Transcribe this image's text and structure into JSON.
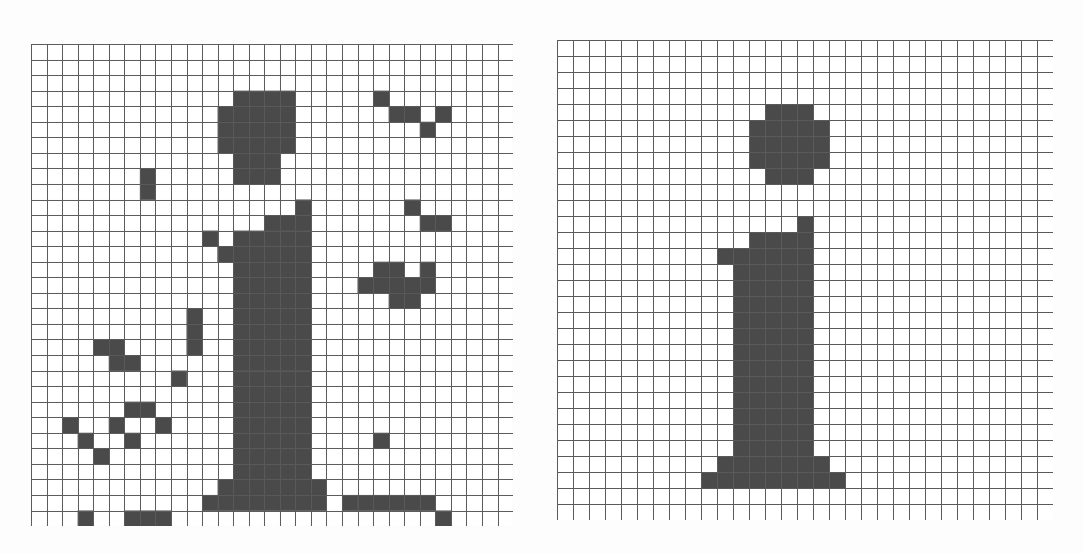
{
  "document": {
    "title": "Bitmap character grids — noisy and clean rendering of the letter i",
    "background_color": "#fdfdfd",
    "width": 1083,
    "height": 554
  },
  "style": {
    "cell_fill_color": "#4a4a4a",
    "grid_line_color": "#5a5a5a",
    "grid_line_width": 1,
    "empty_cell_color": "#ffffff"
  },
  "panels": [
    {
      "id": "left-panel",
      "name": "noisy-bitmap-grid",
      "label": "Noisy bitmap of letter i",
      "origin_x": 31,
      "origin_y": 44,
      "cell_size": 15.55,
      "cols": 31,
      "rows": 31,
      "filled_cells": [
        [
          13,
          3
        ],
        [
          14,
          3
        ],
        [
          15,
          3
        ],
        [
          16,
          3
        ],
        [
          22,
          3
        ],
        [
          12,
          4
        ],
        [
          13,
          4
        ],
        [
          14,
          4
        ],
        [
          15,
          4
        ],
        [
          16,
          4
        ],
        [
          23,
          4
        ],
        [
          24,
          4
        ],
        [
          26,
          4
        ],
        [
          12,
          5
        ],
        [
          13,
          5
        ],
        [
          14,
          5
        ],
        [
          15,
          5
        ],
        [
          16,
          5
        ],
        [
          25,
          5
        ],
        [
          12,
          6
        ],
        [
          13,
          6
        ],
        [
          14,
          6
        ],
        [
          15,
          6
        ],
        [
          16,
          6
        ],
        [
          13,
          7
        ],
        [
          14,
          7
        ],
        [
          15,
          7
        ],
        [
          7,
          8
        ],
        [
          13,
          8
        ],
        [
          14,
          8
        ],
        [
          15,
          8
        ],
        [
          7,
          9
        ],
        [
          17,
          10
        ],
        [
          24,
          10
        ],
        [
          15,
          11
        ],
        [
          16,
          11
        ],
        [
          17,
          11
        ],
        [
          25,
          11
        ],
        [
          26,
          11
        ],
        [
          11,
          12
        ],
        [
          12,
          13
        ],
        [
          13,
          12
        ],
        [
          14,
          12
        ],
        [
          15,
          12
        ],
        [
          16,
          12
        ],
        [
          17,
          12
        ],
        [
          12,
          13
        ],
        [
          13,
          13
        ],
        [
          14,
          13
        ],
        [
          15,
          13
        ],
        [
          16,
          13
        ],
        [
          17,
          13
        ],
        [
          13,
          14
        ],
        [
          14,
          14
        ],
        [
          15,
          14
        ],
        [
          16,
          14
        ],
        [
          17,
          14
        ],
        [
          22,
          14
        ],
        [
          23,
          14
        ],
        [
          25,
          14
        ],
        [
          13,
          15
        ],
        [
          14,
          15
        ],
        [
          15,
          15
        ],
        [
          16,
          15
        ],
        [
          17,
          15
        ],
        [
          21,
          15
        ],
        [
          22,
          15
        ],
        [
          23,
          15
        ],
        [
          24,
          15
        ],
        [
          25,
          15
        ],
        [
          13,
          16
        ],
        [
          14,
          16
        ],
        [
          15,
          16
        ],
        [
          16,
          16
        ],
        [
          17,
          16
        ],
        [
          23,
          16
        ],
        [
          24,
          16
        ],
        [
          10,
          17
        ],
        [
          13,
          17
        ],
        [
          14,
          17
        ],
        [
          15,
          17
        ],
        [
          16,
          17
        ],
        [
          17,
          17
        ],
        [
          10,
          18
        ],
        [
          13,
          18
        ],
        [
          14,
          18
        ],
        [
          15,
          18
        ],
        [
          16,
          18
        ],
        [
          17,
          18
        ],
        [
          4,
          19
        ],
        [
          5,
          19
        ],
        [
          10,
          19
        ],
        [
          13,
          19
        ],
        [
          14,
          19
        ],
        [
          15,
          19
        ],
        [
          16,
          19
        ],
        [
          17,
          19
        ],
        [
          5,
          20
        ],
        [
          6,
          20
        ],
        [
          13,
          20
        ],
        [
          14,
          20
        ],
        [
          15,
          20
        ],
        [
          16,
          20
        ],
        [
          17,
          20
        ],
        [
          9,
          21
        ],
        [
          13,
          21
        ],
        [
          14,
          21
        ],
        [
          15,
          21
        ],
        [
          16,
          21
        ],
        [
          17,
          21
        ],
        [
          13,
          22
        ],
        [
          14,
          22
        ],
        [
          15,
          22
        ],
        [
          16,
          22
        ],
        [
          17,
          22
        ],
        [
          6,
          23
        ],
        [
          7,
          23
        ],
        [
          13,
          23
        ],
        [
          14,
          23
        ],
        [
          15,
          23
        ],
        [
          16,
          23
        ],
        [
          17,
          23
        ],
        [
          2,
          24
        ],
        [
          5,
          24
        ],
        [
          8,
          24
        ],
        [
          13,
          24
        ],
        [
          14,
          24
        ],
        [
          15,
          24
        ],
        [
          16,
          24
        ],
        [
          17,
          24
        ],
        [
          3,
          25
        ],
        [
          6,
          25
        ],
        [
          13,
          25
        ],
        [
          14,
          25
        ],
        [
          15,
          25
        ],
        [
          16,
          25
        ],
        [
          17,
          25
        ],
        [
          22,
          25
        ],
        [
          4,
          26
        ],
        [
          13,
          26
        ],
        [
          14,
          26
        ],
        [
          15,
          26
        ],
        [
          16,
          26
        ],
        [
          17,
          26
        ],
        [
          13,
          27
        ],
        [
          14,
          27
        ],
        [
          15,
          27
        ],
        [
          16,
          27
        ],
        [
          17,
          27
        ],
        [
          12,
          28
        ],
        [
          13,
          28
        ],
        [
          14,
          28
        ],
        [
          15,
          28
        ],
        [
          16,
          28
        ],
        [
          17,
          28
        ],
        [
          18,
          28
        ],
        [
          11,
          29
        ],
        [
          12,
          29
        ],
        [
          13,
          29
        ],
        [
          14,
          29
        ],
        [
          15,
          29
        ],
        [
          16,
          29
        ],
        [
          17,
          29
        ],
        [
          18,
          29
        ],
        [
          20,
          29
        ],
        [
          21,
          29
        ],
        [
          22,
          29
        ],
        [
          23,
          29
        ],
        [
          24,
          29
        ],
        [
          25,
          29
        ],
        [
          3,
          30
        ],
        [
          6,
          30
        ],
        [
          7,
          30
        ],
        [
          8,
          30
        ],
        [
          26,
          30
        ]
      ]
    },
    {
      "id": "right-panel",
      "name": "clean-bitmap-grid",
      "label": "Clean bitmap of letter i",
      "origin_x": 557,
      "origin_y": 40,
      "cell_size": 16.0,
      "cols": 31,
      "rows": 30,
      "filled_cells": [
        [
          13,
          4
        ],
        [
          14,
          4
        ],
        [
          15,
          4
        ],
        [
          12,
          5
        ],
        [
          13,
          5
        ],
        [
          14,
          5
        ],
        [
          15,
          5
        ],
        [
          16,
          5
        ],
        [
          12,
          6
        ],
        [
          13,
          6
        ],
        [
          14,
          6
        ],
        [
          15,
          6
        ],
        [
          16,
          6
        ],
        [
          12,
          7
        ],
        [
          13,
          7
        ],
        [
          14,
          7
        ],
        [
          15,
          7
        ],
        [
          16,
          7
        ],
        [
          13,
          8
        ],
        [
          14,
          8
        ],
        [
          15,
          8
        ],
        [
          15,
          11
        ],
        [
          12,
          12
        ],
        [
          13,
          12
        ],
        [
          14,
          12
        ],
        [
          15,
          12
        ],
        [
          10,
          13
        ],
        [
          11,
          13
        ],
        [
          12,
          13
        ],
        [
          13,
          13
        ],
        [
          14,
          13
        ],
        [
          15,
          13
        ],
        [
          11,
          14
        ],
        [
          12,
          14
        ],
        [
          13,
          14
        ],
        [
          14,
          14
        ],
        [
          15,
          14
        ],
        [
          11,
          15
        ],
        [
          12,
          15
        ],
        [
          13,
          15
        ],
        [
          14,
          15
        ],
        [
          15,
          15
        ],
        [
          11,
          16
        ],
        [
          12,
          16
        ],
        [
          13,
          16
        ],
        [
          14,
          16
        ],
        [
          15,
          16
        ],
        [
          11,
          17
        ],
        [
          12,
          17
        ],
        [
          13,
          17
        ],
        [
          14,
          17
        ],
        [
          15,
          17
        ],
        [
          11,
          18
        ],
        [
          12,
          18
        ],
        [
          13,
          18
        ],
        [
          14,
          18
        ],
        [
          15,
          18
        ],
        [
          11,
          19
        ],
        [
          12,
          19
        ],
        [
          13,
          19
        ],
        [
          14,
          19
        ],
        [
          15,
          19
        ],
        [
          11,
          20
        ],
        [
          12,
          20
        ],
        [
          13,
          20
        ],
        [
          14,
          20
        ],
        [
          15,
          20
        ],
        [
          11,
          21
        ],
        [
          12,
          21
        ],
        [
          13,
          21
        ],
        [
          14,
          21
        ],
        [
          15,
          21
        ],
        [
          11,
          22
        ],
        [
          12,
          22
        ],
        [
          13,
          22
        ],
        [
          14,
          22
        ],
        [
          15,
          22
        ],
        [
          11,
          23
        ],
        [
          12,
          23
        ],
        [
          13,
          23
        ],
        [
          14,
          23
        ],
        [
          15,
          23
        ],
        [
          11,
          24
        ],
        [
          12,
          24
        ],
        [
          13,
          24
        ],
        [
          14,
          24
        ],
        [
          15,
          24
        ],
        [
          11,
          25
        ],
        [
          12,
          25
        ],
        [
          13,
          25
        ],
        [
          14,
          25
        ],
        [
          15,
          25
        ],
        [
          10,
          26
        ],
        [
          11,
          26
        ],
        [
          12,
          26
        ],
        [
          13,
          26
        ],
        [
          14,
          26
        ],
        [
          15,
          26
        ],
        [
          16,
          26
        ],
        [
          9,
          27
        ],
        [
          10,
          27
        ],
        [
          11,
          27
        ],
        [
          12,
          27
        ],
        [
          13,
          27
        ],
        [
          14,
          27
        ],
        [
          15,
          27
        ],
        [
          16,
          27
        ],
        [
          17,
          27
        ]
      ]
    }
  ]
}
